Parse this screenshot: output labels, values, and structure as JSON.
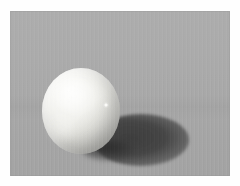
{
  "image": {
    "kind": "photograph",
    "caption": "A matte white sphere resting on a flat gray studio surface, lit from the upper left, casting a soft elliptical shadow toward the lower right.",
    "subject": "white sphere",
    "surface": "gray studio sweep",
    "lighting": "key light from upper left",
    "frame_label": "photo-plate",
    "dimensions": {
      "width_px": 240,
      "height_px": 186,
      "plate_left_px": 10,
      "plate_top_px": 11,
      "plate_width_px": 220,
      "plate_height_px": 165
    },
    "colors": {
      "margin": "#fefefe",
      "background_top": "#adadad",
      "background_bottom": "#a3a3a3",
      "sphere_lit": "#fdfdfb",
      "sphere_midtone": "#d6d6d1",
      "sphere_shaded": "#9a9a96",
      "cast_shadow": "#3a3a3a",
      "contact_shadow": "#282828",
      "specular_dot": "#ffffff"
    },
    "elements": {
      "sphere": {
        "label": "white sphere",
        "center_x_px": 81,
        "center_y_px": 111,
        "radius_x_px": 39,
        "radius_y_px": 43
      },
      "cast_shadow": {
        "label": "cast shadow",
        "center_x_px": 141,
        "center_y_px": 140,
        "radius_x_px": 48,
        "radius_y_px": 26
      },
      "contact_shadow": {
        "label": "contact shadow",
        "center_x_px": 111,
        "center_y_px": 150
      },
      "specular_dot": {
        "label": "specular highlight dot",
        "center_x_px": 106,
        "center_y_px": 104,
        "size_px": 4
      },
      "diffuse_highlight": {
        "label": "diffuse highlight",
        "center_x_px": 66,
        "center_y_px": 88
      }
    }
  }
}
